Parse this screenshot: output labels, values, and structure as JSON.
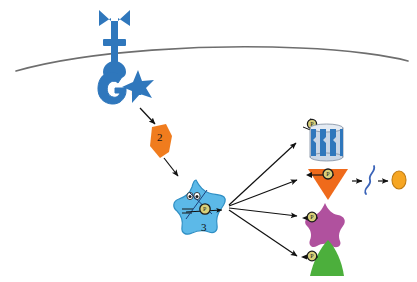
{
  "figure": {
    "title": "",
    "background_color": "#ffffff",
    "width": 417,
    "height": 282
  },
  "membrane": {
    "name": "plasma-membrane",
    "color": "#6e6e6e",
    "stroke_width": 1.6
  },
  "palette": {
    "receptor_blue": "#2f77bc",
    "effector_star_blue": "#5cb9e8",
    "effector_star_outline": "#2f8fc4",
    "second_messenger_orange": "#f07c1e",
    "channel_blue": "#2f77bc",
    "channel_light": "#c9d6e6",
    "enzyme_orange": "#ef6a1b",
    "target_purple": "#b0519e",
    "target_green": "#4caf3c",
    "substrate_blue": "#3a63b8",
    "product_orange": "#f6a623",
    "phosphate_fill": "#d8d07a",
    "phosphate_ring": "#1a1a1a",
    "arrow_black": "#111111"
  },
  "elements": {
    "receptor": {
      "name": "membrane-receptor",
      "label": "",
      "color": "#2f77bc"
    },
    "g_protein": {
      "name": "g-protein",
      "label": "G",
      "color": "#2f77bc"
    },
    "effector_enzyme_membrane": {
      "name": "membrane-effector-enzyme",
      "label": "E",
      "color": "#2f77bc"
    },
    "second_messenger": {
      "name": "second-messenger",
      "label": "2",
      "color": "#f07c1e"
    },
    "protein_kinase": {
      "name": "protein-kinase",
      "label": "3",
      "color": "#5cb9e8",
      "phosphate_label": "P"
    },
    "targets": [
      {
        "name": "ion-channel",
        "shape": "channel",
        "label": "",
        "phosphate_label": "P",
        "color": "#2f77bc"
      },
      {
        "name": "target-enzyme",
        "shape": "triangle-down",
        "label": "",
        "phosphate_label": "P",
        "color": "#ef6a1b"
      },
      {
        "name": "target-protein-star",
        "shape": "star",
        "label": "",
        "phosphate_label": "P",
        "color": "#b0519e"
      },
      {
        "name": "target-protein-cone",
        "shape": "cone",
        "label": "",
        "phosphate_label": "P",
        "color": "#4caf3c"
      }
    ],
    "substrate": {
      "name": "substrate-molecule",
      "label": "",
      "color": "#3a63b8"
    },
    "product": {
      "name": "product-molecule",
      "label": "",
      "color": "#f6a623"
    }
  },
  "arrows": {
    "receptor_to_messenger": {
      "name": "arrow-receptor-to-second-messenger"
    },
    "messenger_to_kinase": {
      "name": "arrow-second-messenger-to-kinase"
    },
    "kinase_to_targets": [
      {
        "name": "arrow-kinase-to-ion-channel"
      },
      {
        "name": "arrow-kinase-to-target-enzyme"
      },
      {
        "name": "arrow-kinase-to-target-star"
      },
      {
        "name": "arrow-kinase-to-target-cone"
      }
    ],
    "enzyme_to_substrate": {
      "name": "arrow-enzyme-to-substrate"
    },
    "substrate_to_product": {
      "name": "arrow-substrate-to-product"
    }
  }
}
